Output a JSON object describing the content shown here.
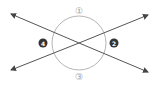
{
  "diagram": {
    "colors": {
      "line": "#555555",
      "circle": "#b0b0b0",
      "label_outline": "#9a9a9a",
      "label_filled": "#333333"
    },
    "labels": {
      "top": "①",
      "right": "2",
      "bottom": "③",
      "left": "4"
    }
  }
}
